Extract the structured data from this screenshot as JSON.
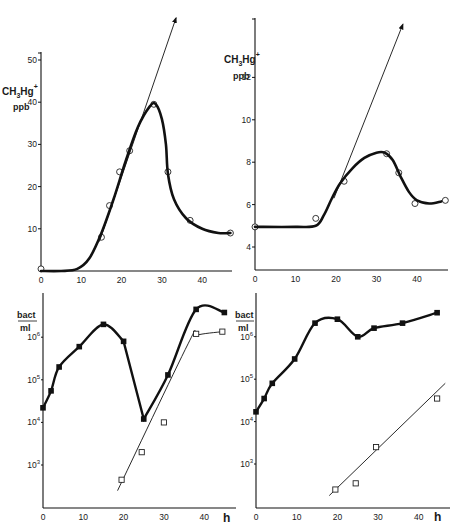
{
  "chart_data": [
    {
      "id": "top_left",
      "type": "line",
      "title": "",
      "xlabel": "",
      "ylabel": "CH3Hg+ ppb",
      "ylabel_parts": {
        "main": "CH",
        "sub": "3",
        "mid": "Hg",
        "sup": "+",
        "unit": "ppb"
      },
      "xlim": [
        0,
        47
      ],
      "ylim": [
        0,
        55
      ],
      "xticks": [
        0,
        10,
        20,
        30,
        40
      ],
      "yticks": [
        10,
        20,
        30,
        40,
        50
      ],
      "grid": false,
      "series": [
        {
          "name": "measured",
          "marker": "open-circle",
          "x": [
            0,
            15,
            17,
            19.5,
            22,
            28,
            31.5,
            37,
            47
          ],
          "y": [
            0.5,
            8,
            15.5,
            23.5,
            28.5,
            39.5,
            23.5,
            12,
            9
          ]
        },
        {
          "name": "fitted-curve",
          "marker": "none",
          "style": "thick",
          "x": [
            0,
            5,
            9,
            12,
            15,
            18,
            21,
            24,
            27,
            28.5,
            30,
            31,
            31.5,
            33,
            36,
            40,
            44,
            47
          ],
          "y": [
            0,
            0,
            0.5,
            3,
            9,
            17,
            26,
            34,
            39,
            39.5,
            36,
            30,
            23,
            17,
            12.5,
            10,
            9,
            9
          ]
        },
        {
          "name": "initial-rate-tangent",
          "marker": "arrow",
          "style": "thin",
          "x": [
            14.5,
            33.5
          ],
          "y": [
            7,
            60
          ]
        }
      ]
    },
    {
      "id": "top_right",
      "type": "line",
      "title": "",
      "xlabel": "",
      "ylabel": "CH3Hg+ ppb",
      "ylabel_parts": {
        "main": "CH",
        "sub": "3",
        "mid": "Hg",
        "sup": "+",
        "unit": "ppb"
      },
      "xlim": [
        0,
        47
      ],
      "ylim": [
        3,
        14
      ],
      "xticks": [
        0,
        10,
        20,
        30,
        40
      ],
      "yticks": [
        4,
        6,
        8,
        10,
        12
      ],
      "grid": false,
      "series": [
        {
          "name": "measured",
          "marker": "open-circle",
          "x": [
            0,
            15,
            22,
            32.5,
            35.5,
            39.5,
            47
          ],
          "y": [
            4.95,
            5.35,
            7.1,
            8.4,
            7.5,
            6.05,
            6.2
          ]
        },
        {
          "name": "fitted-curve",
          "marker": "none",
          "style": "thick",
          "x": [
            0,
            10,
            15,
            17,
            19,
            21,
            24,
            27,
            30,
            32,
            34,
            36,
            38,
            40,
            43,
            46
          ],
          "y": [
            4.95,
            4.95,
            5.0,
            5.5,
            6.3,
            7.0,
            7.7,
            8.2,
            8.45,
            8.45,
            8.1,
            7.3,
            6.6,
            6.2,
            6.05,
            6.15
          ]
        },
        {
          "name": "initial-rate-tangent",
          "marker": "arrow",
          "style": "thin",
          "x": [
            19.5,
            36.5
          ],
          "y": [
            6.3,
            14.5
          ]
        }
      ]
    },
    {
      "id": "bottom_left",
      "type": "line",
      "title": "",
      "xlabel": "h",
      "ylabel": "bact/ml",
      "ylabel_parts": {
        "num": "bact",
        "den": "ml"
      },
      "yscale": "log",
      "xlim": [
        0,
        47
      ],
      "ylim": [
        100,
        10000000
      ],
      "xticks": [
        0,
        10,
        20,
        30,
        40
      ],
      "yticks": [
        "10^3",
        "10^4",
        "10^5",
        "10^6"
      ],
      "grid": false,
      "series": [
        {
          "name": "total-bacteria",
          "marker": "filled-square",
          "x": [
            0,
            2,
            4,
            9,
            15,
            20,
            25,
            31,
            38,
            45
          ],
          "y": [
            22000,
            55000,
            200000,
            600000,
            2000000,
            800000,
            12000,
            130000,
            4500000,
            3800000
          ]
        },
        {
          "name": "second-population",
          "marker": "open-square",
          "x": [
            19.5,
            24.5,
            30,
            38,
            44.5
          ],
          "y": [
            450,
            2000,
            10000,
            1200000,
            1350000
          ]
        }
      ]
    },
    {
      "id": "bottom_right",
      "type": "line",
      "title": "",
      "xlabel": "h",
      "ylabel": "bact/ml",
      "ylabel_parts": {
        "num": "bact",
        "den": "ml"
      },
      "yscale": "log",
      "xlim": [
        0,
        47
      ],
      "ylim": [
        100,
        10000000
      ],
      "xticks": [
        0,
        10,
        20,
        30,
        40
      ],
      "yticks": [
        "10^3",
        "10^4",
        "10^5",
        "10^6"
      ],
      "grid": false,
      "series": [
        {
          "name": "total-bacteria",
          "marker": "filled-square",
          "x": [
            0,
            2,
            4,
            9.5,
            14.5,
            20,
            25,
            29,
            36,
            44.5
          ],
          "y": [
            17000,
            35000,
            80000,
            300000,
            2100000,
            2600000,
            1000000,
            1600000,
            2100000,
            3700000
          ]
        },
        {
          "name": "second-population",
          "marker": "open-square",
          "x": [
            19.5,
            24.5,
            29.5,
            44.5
          ],
          "y": [
            250,
            350,
            2500,
            35000
          ]
        }
      ]
    }
  ],
  "labels": {
    "ch3hg_main": "CH",
    "ch3hg_sub": "3",
    "ch3hg_mid": "Hg",
    "ch3hg_sup": "+",
    "ppb": "ppb",
    "bact": "bact",
    "ml": "ml",
    "hours": "h"
  }
}
